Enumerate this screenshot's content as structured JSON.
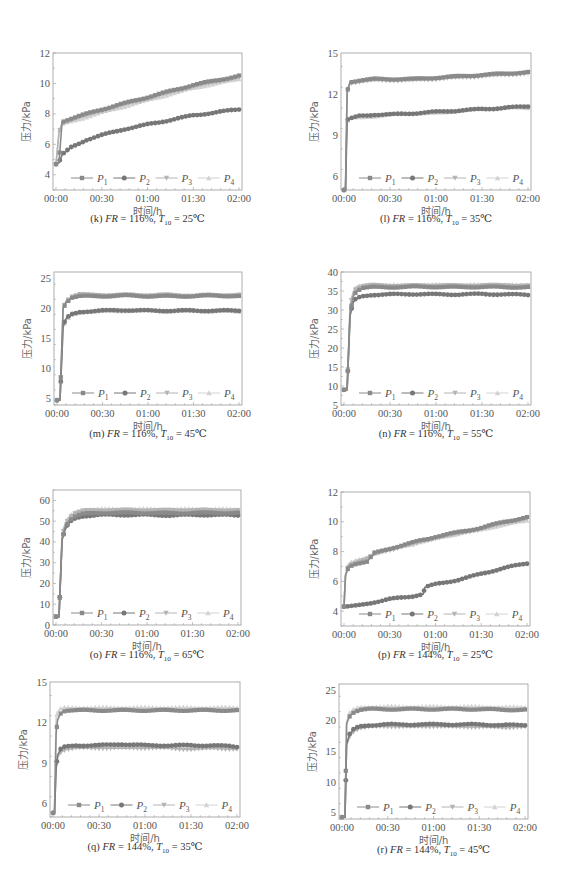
{
  "series_names": [
    "P1",
    "P2",
    "P3",
    "P4"
  ],
  "legend": [
    {
      "label": "P",
      "sub": "1",
      "marker": "square",
      "color": "#8a8a8a"
    },
    {
      "label": "P",
      "sub": "2",
      "marker": "circle",
      "color": "#777777"
    },
    {
      "label": "P",
      "sub": "3",
      "marker": "tri-down",
      "color": "#b4b4b4"
    },
    {
      "label": "P",
      "sub": "4",
      "marker": "tri-up",
      "color": "#d2d2d2"
    }
  ],
  "xlabel": "时间/h",
  "ylabel": "压力/kPa",
  "xticks": [
    "00:00",
    "00:30",
    "01:00",
    "01:30",
    "02:00"
  ],
  "chart_data": [
    {
      "id": "k",
      "type": "line",
      "caption": {
        "prefix": "(k) ",
        "fr_label": "FR",
        "fr": " = 116%, ",
        "t_label": "T",
        "t_sub": "10",
        "t": " = 25℃"
      },
      "title": "(k) FR = 116%, T10 = 25℃",
      "xlabel": "时间/h",
      "ylabel": "压力/kPa",
      "ylim": [
        3,
        12
      ],
      "yticks": [
        4,
        6,
        8,
        10,
        12
      ],
      "x_minutes": [
        0,
        2,
        4,
        10,
        20,
        30,
        45,
        60,
        75,
        90,
        105,
        120
      ],
      "series": [
        {
          "name": "P1",
          "values": [
            4.7,
            4.8,
            7.5,
            7.7,
            8.0,
            8.3,
            8.7,
            9.1,
            9.5,
            9.9,
            10.2,
            10.5
          ]
        },
        {
          "name": "P2",
          "values": [
            4.7,
            4.8,
            5.3,
            5.8,
            6.3,
            6.6,
            7.0,
            7.3,
            7.6,
            7.9,
            8.1,
            8.3
          ]
        },
        {
          "name": "P3",
          "values": [
            4.7,
            6.8,
            7.4,
            7.6,
            7.9,
            8.2,
            8.6,
            9.0,
            9.4,
            9.8,
            10.1,
            10.4
          ]
        },
        {
          "name": "P4",
          "values": [
            4.7,
            6.8,
            7.3,
            7.5,
            7.8,
            8.1,
            8.5,
            8.9,
            9.3,
            9.7,
            10.0,
            10.3
          ]
        }
      ],
      "legend_position": "bottom-inside"
    },
    {
      "id": "l",
      "type": "line",
      "caption": {
        "prefix": "(l) ",
        "fr_label": "FR",
        "fr": " = 116%, ",
        "t_label": "T",
        "t_sub": "10",
        "t": " = 35℃"
      },
      "title": "(l) FR = 116%, T10 = 35℃",
      "xlabel": "时间/h",
      "ylabel": "压力/kPa",
      "ylim": [
        5,
        15
      ],
      "yticks": [
        6,
        9,
        12,
        15
      ],
      "x_minutes": [
        0,
        1,
        2,
        4,
        10,
        20,
        30,
        45,
        60,
        75,
        90,
        105,
        120
      ],
      "series": [
        {
          "name": "P1",
          "values": [
            5,
            5,
            12.2,
            12.9,
            13.0,
            13.1,
            13.1,
            13.1,
            13.2,
            13.3,
            13.4,
            13.5,
            13.6
          ]
        },
        {
          "name": "P2",
          "values": [
            5,
            5,
            10.1,
            10.2,
            10.4,
            10.5,
            10.5,
            10.6,
            10.7,
            10.8,
            10.9,
            11.0,
            11.1
          ]
        },
        {
          "name": "P3",
          "values": [
            5,
            5,
            12.1,
            12.8,
            12.9,
            13.0,
            13.0,
            13.0,
            13.1,
            13.2,
            13.3,
            13.4,
            13.5
          ]
        },
        {
          "name": "P4",
          "values": [
            5,
            5,
            10.0,
            10.2,
            10.3,
            10.4,
            10.5,
            10.6,
            10.6,
            10.8,
            10.9,
            11.0,
            11.0
          ]
        }
      ],
      "legend_position": "bottom-inside"
    },
    {
      "id": "m",
      "type": "line",
      "caption": {
        "prefix": "(m) ",
        "fr_label": "FR",
        "fr": " = 116%, ",
        "t_label": "T",
        "t_sub": "10",
        "t": " = 45℃"
      },
      "title": "(m) FR = 116%, T10 = 45℃",
      "xlabel": "时间/h",
      "ylabel": "压力/kPa",
      "ylim": [
        4,
        26
      ],
      "yticks": [
        5,
        10,
        15,
        20,
        25
      ],
      "x_minutes": [
        0,
        2,
        4,
        6,
        10,
        15,
        20,
        30,
        45,
        60,
        75,
        90,
        105,
        120
      ],
      "series": [
        {
          "name": "P1",
          "values": [
            4.8,
            4.8,
            20.0,
            21.0,
            21.8,
            22.0,
            22.0,
            22.0,
            22.1,
            22.0,
            22.0,
            22.0,
            22.1,
            22.0
          ]
        },
        {
          "name": "P2",
          "values": [
            4.8,
            4.8,
            17.0,
            18.3,
            19.0,
            19.4,
            19.5,
            19.6,
            19.7,
            19.6,
            19.6,
            19.6,
            19.6,
            19.6
          ]
        },
        {
          "name": "P3",
          "values": [
            4.8,
            4.8,
            20.1,
            21.2,
            22.0,
            22.3,
            22.2,
            22.2,
            22.2,
            22.2,
            22.2,
            22.1,
            22.2,
            22.2
          ]
        },
        {
          "name": "P4",
          "values": [
            4.8,
            4.8,
            16.8,
            18.0,
            18.9,
            19.3,
            19.5,
            19.5,
            19.6,
            19.6,
            19.5,
            19.6,
            19.5,
            19.5
          ]
        }
      ],
      "legend_position": "bottom-inside"
    },
    {
      "id": "n",
      "type": "line",
      "caption": {
        "prefix": "(n) ",
        "fr_label": "FR",
        "fr": " = 116%, ",
        "t_label": "T",
        "t_sub": "10",
        "t": " = 55℃"
      },
      "title": "(n) FR = 116%, T10 = 55℃",
      "xlabel": "时间/h",
      "ylabel": "压力/kPa",
      "ylim": [
        5,
        40
      ],
      "yticks": [
        5,
        10,
        15,
        20,
        25,
        30,
        35,
        40
      ],
      "x_minutes": [
        0,
        2,
        4,
        6,
        8,
        12,
        18,
        30,
        45,
        60,
        75,
        90,
        105,
        120
      ],
      "series": [
        {
          "name": "P1",
          "values": [
            9.0,
            9.0,
            29.0,
            33.5,
            35.0,
            35.8,
            36.0,
            36.0,
            36.1,
            36.1,
            36.0,
            36.1,
            36.0,
            36.0
          ]
        },
        {
          "name": "P2",
          "values": [
            9.0,
            9.0,
            28.5,
            32.0,
            33.0,
            33.6,
            34.0,
            34.1,
            34.2,
            34.1,
            34.1,
            34.2,
            34.1,
            34.0
          ]
        },
        {
          "name": "P3",
          "values": [
            9.0,
            9.0,
            31.0,
            34.5,
            35.8,
            36.3,
            36.5,
            36.4,
            36.4,
            36.5,
            36.4,
            36.5,
            36.5,
            36.4
          ]
        },
        {
          "name": "P4",
          "values": [
            9.0,
            9.0,
            31.2,
            34.8,
            36.0,
            36.5,
            36.6,
            36.5,
            36.6,
            36.6,
            36.5,
            36.6,
            36.6,
            36.5
          ]
        }
      ],
      "legend_position": "bottom-inside"
    },
    {
      "id": "o",
      "type": "line",
      "caption": {
        "prefix": "(o) ",
        "fr_label": "FR",
        "fr": " = 116%, ",
        "t_label": "T",
        "t_sub": "10",
        "t": " = 65℃"
      },
      "title": "(o) FR = 116%, T10 = 65℃",
      "xlabel": "时间/h",
      "ylabel": "压力/kPa",
      "ylim": [
        0,
        65
      ],
      "yticks": [
        0,
        10,
        20,
        30,
        40,
        50,
        60
      ],
      "x_minutes": [
        0,
        2,
        4,
        6,
        9,
        13,
        18,
        30,
        45,
        60,
        75,
        90,
        105,
        120
      ],
      "series": [
        {
          "name": "P1",
          "values": [
            4.0,
            4.0,
            41.0,
            47.0,
            50.5,
            52.5,
            53.5,
            54.0,
            54.0,
            54.0,
            53.8,
            54.0,
            54.0,
            54.0
          ]
        },
        {
          "name": "P2",
          "values": [
            4.0,
            4.0,
            41.0,
            46.0,
            49.5,
            51.5,
            52.5,
            53.0,
            53.0,
            53.0,
            52.8,
            53.0,
            53.0,
            52.8
          ]
        },
        {
          "name": "P3",
          "values": [
            4.0,
            4.0,
            42.5,
            48.5,
            52.0,
            54.0,
            55.0,
            55.2,
            55.3,
            55.2,
            55.2,
            55.3,
            55.2,
            55.2
          ]
        },
        {
          "name": "P4",
          "values": [
            4.0,
            4.0,
            43.0,
            49.0,
            52.5,
            54.5,
            55.5,
            55.8,
            55.8,
            55.8,
            55.7,
            55.8,
            55.8,
            55.6
          ]
        }
      ],
      "legend_position": "bottom-inside"
    },
    {
      "id": "p",
      "type": "line",
      "caption": {
        "prefix": "(p) ",
        "fr_label": "FR",
        "fr": " = 144%, ",
        "t_label": "T",
        "t_sub": "10",
        "t": " = 25℃"
      },
      "title": "(p) FR = 144%, T10 = 25℃",
      "xlabel": "时间/h",
      "ylabel": "压力/kPa",
      "ylim": [
        3,
        12
      ],
      "yticks": [
        4,
        6,
        8,
        10,
        12
      ],
      "x_minutes": [
        0,
        1,
        3,
        8,
        15,
        20,
        30,
        45,
        52,
        53,
        60,
        75,
        90,
        105,
        120
      ],
      "series": [
        {
          "name": "P1",
          "values": [
            4.3,
            6.4,
            7.0,
            7.2,
            7.3,
            7.9,
            8.2,
            8.6,
            8.8,
            8.8,
            9.0,
            9.3,
            9.6,
            10.0,
            10.3
          ]
        },
        {
          "name": "P2",
          "values": [
            4.3,
            4.3,
            4.3,
            4.35,
            4.5,
            4.6,
            4.8,
            5.0,
            5.15,
            5.6,
            5.8,
            6.1,
            6.5,
            6.9,
            7.2
          ]
        },
        {
          "name": "P3",
          "values": [
            4.3,
            6.4,
            7.1,
            7.3,
            7.5,
            7.8,
            8.1,
            8.5,
            8.7,
            8.7,
            8.9,
            9.2,
            9.5,
            9.9,
            10.2
          ]
        },
        {
          "name": "P4",
          "values": [
            4.3,
            6.4,
            7.2,
            7.4,
            7.6,
            7.9,
            8.2,
            8.5,
            8.7,
            8.7,
            8.9,
            9.2,
            9.5,
            9.8,
            10.1
          ]
        }
      ],
      "legend_position": "bottom-inside"
    },
    {
      "id": "q",
      "type": "line",
      "caption": {
        "prefix": "(q) ",
        "fr_label": "FR",
        "fr": " = 144%, ",
        "t_label": "T",
        "t_sub": "10",
        "t": " = 35℃"
      },
      "title": "(q) FR = 144%, T10 = 35℃",
      "xlabel": "时间/h",
      "ylabel": "压力/kPa",
      "ylim": [
        5,
        15
      ],
      "yticks": [
        6,
        9,
        12,
        15
      ],
      "x_minutes": [
        0,
        1,
        2,
        3,
        5,
        8,
        15,
        30,
        45,
        60,
        75,
        90,
        105,
        120
      ],
      "series": [
        {
          "name": "P1",
          "values": [
            5.3,
            5.3,
            11.2,
            12.2,
            12.7,
            12.9,
            12.9,
            12.9,
            12.9,
            12.9,
            12.9,
            12.9,
            12.9,
            12.9
          ]
        },
        {
          "name": "P2",
          "values": [
            5.3,
            5.3,
            8.6,
            9.6,
            10.0,
            10.2,
            10.3,
            10.3,
            10.4,
            10.3,
            10.3,
            10.3,
            10.3,
            10.2
          ]
        },
        {
          "name": "P3",
          "values": [
            5.3,
            5.3,
            8.6,
            9.4,
            9.8,
            10.0,
            10.1,
            10.1,
            10.1,
            10.1,
            10.1,
            10.0,
            10.1,
            10.0
          ]
        },
        {
          "name": "P4",
          "values": [
            5.3,
            5.3,
            12.3,
            12.8,
            13.0,
            13.1,
            13.1,
            13.1,
            13.1,
            13.1,
            13.1,
            13.1,
            13.1,
            13.1
          ]
        }
      ],
      "legend_position": "bottom-inside"
    },
    {
      "id": "r",
      "type": "line",
      "caption": {
        "prefix": "(r) ",
        "fr_label": "FR",
        "fr": " = 144%, ",
        "t_label": "T",
        "t_sub": "10",
        "t": " = 45℃"
      },
      "title": "(r) FR = 144%, T10 = 45℃",
      "xlabel": "时间/h",
      "ylabel": "压力/kPa",
      "ylim": [
        4,
        26
      ],
      "yticks": [
        5,
        10,
        15,
        20,
        25
      ],
      "x_minutes": [
        0,
        2,
        3,
        5,
        8,
        12,
        18,
        30,
        45,
        60,
        75,
        90,
        105,
        120
      ],
      "series": [
        {
          "name": "P1",
          "values": [
            4.3,
            4.3,
            19.5,
            20.8,
            21.5,
            21.8,
            21.9,
            21.9,
            21.9,
            21.9,
            21.9,
            21.9,
            21.8,
            21.8
          ]
        },
        {
          "name": "P2",
          "values": [
            4.3,
            4.3,
            16.2,
            17.8,
            18.7,
            19.1,
            19.3,
            19.4,
            19.4,
            19.4,
            19.4,
            19.4,
            19.3,
            19.3
          ]
        },
        {
          "name": "P3",
          "values": [
            4.3,
            4.3,
            16.0,
            17.5,
            18.4,
            18.8,
            19.0,
            19.1,
            19.0,
            19.1,
            19.0,
            19.0,
            18.9,
            19.0
          ]
        },
        {
          "name": "P4",
          "values": [
            4.3,
            4.3,
            19.8,
            21.2,
            21.9,
            22.2,
            22.3,
            22.3,
            22.3,
            22.3,
            22.3,
            22.3,
            22.2,
            22.2
          ]
        }
      ],
      "legend_position": "bottom-inside"
    }
  ],
  "layout": {
    "panels": [
      {
        "left": 0,
        "top": 0,
        "plot": [
          53,
          53,
          242,
          190
        ],
        "caption_top": 212
      },
      {
        "left": 283,
        "top": 0,
        "plot": [
          58,
          53,
          248,
          190
        ],
        "caption_top": 212
      },
      {
        "left": 0,
        "top": 220,
        "plot": [
          54,
          52,
          242,
          185
        ],
        "caption_top": 207
      },
      {
        "left": 283,
        "top": 220,
        "plot": [
          58,
          52,
          248,
          185
        ],
        "caption_top": 207
      },
      {
        "left": 0,
        "top": 440,
        "plot": [
          53,
          50,
          241,
          185
        ],
        "caption_top": 208
      },
      {
        "left": 283,
        "top": 440,
        "plot": [
          58,
          52,
          247,
          186
        ],
        "caption_top": 208
      },
      {
        "left": 0,
        "top": 660,
        "plot": [
          50,
          22,
          240,
          157
        ],
        "caption_top": 180
      },
      {
        "left": 283,
        "top": 660,
        "plot": [
          56,
          24,
          245,
          159
        ],
        "caption_top": 183
      }
    ]
  }
}
